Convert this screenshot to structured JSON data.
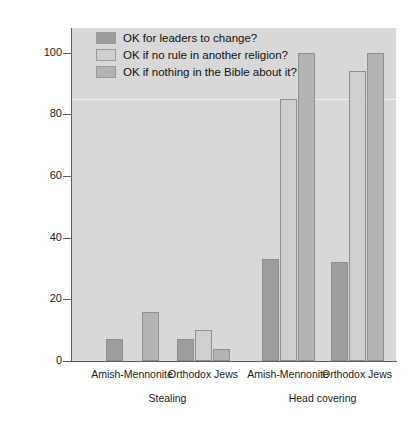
{
  "chart_data": {
    "type": "bar",
    "title": "",
    "xlabel": "",
    "ylabel": "Percentage saying yes",
    "ylim": [
      0,
      108
    ],
    "yticks": [
      0,
      20,
      40,
      60,
      80,
      100
    ],
    "ytick_labels": [
      "0",
      "20",
      "40",
      "60",
      "80",
      "100"
    ],
    "grid": true,
    "gridlines": [
      85
    ],
    "legend_position": "top-left",
    "panel_color": "#d8d8d8",
    "categories": [
      "Amish-Mennonite",
      "Orthodox Jews",
      "Amish-Mennonite",
      "Orthodox Jews"
    ],
    "group_labels": [
      "Stealing",
      "Head covering"
    ],
    "series": [
      {
        "name": "OK for leaders to change?",
        "color": "#9d9d9d",
        "values": [
          7,
          7,
          33,
          32
        ]
      },
      {
        "name": "OK if no rule in another religion?",
        "color": "#cfcfcf",
        "values": [
          null,
          10,
          85,
          94
        ]
      },
      {
        "name": "OK if nothing in the Bible about it?",
        "color": "#b4b4b4",
        "values": [
          16,
          4,
          100,
          100
        ]
      }
    ]
  },
  "legend": {
    "items": [
      {
        "label": "OK for leaders to change?",
        "color": "#9d9d9d"
      },
      {
        "label": "OK if no rule in another religion?",
        "color": "#cfcfcf"
      },
      {
        "label": "OK if nothing in the Bible about it?",
        "color": "#b4b4b4"
      }
    ]
  },
  "axes": {
    "y_title": "Percentage saying yes",
    "y_labels": [
      "100",
      "80",
      "60",
      "40",
      "20",
      "0"
    ],
    "x_category_labels": [
      "Amish-Mennonite",
      "Orthodox Jews",
      "Amish-Mennonite",
      "Orthodox Jews"
    ],
    "x_group_labels": [
      "Stealing",
      "Head covering"
    ]
  }
}
